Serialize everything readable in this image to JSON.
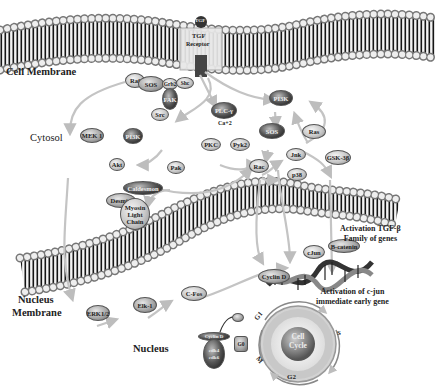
{
  "regions": {
    "cell_membrane": "Cell Membrane",
    "cytosol": "Cytosol",
    "nucleus_membrane_line1": "Nucleus",
    "nucleus_membrane_line2": "Membrane",
    "nucleus": "Nucleus"
  },
  "receptor": {
    "ligand": "TGF",
    "label_line1": "TGF",
    "label_line2": "Receptor"
  },
  "nodes": {
    "raf": "Raf",
    "sos_top": "SOS",
    "grb2": "Grb2",
    "shc": "Shc",
    "fak": "FAK",
    "src": "Src",
    "plc": "PLC-γ",
    "ca": "Ca+2",
    "pkc": "PKC",
    "pyk2": "Pyk2",
    "pi3k_top": "PI3K",
    "sos_mid": "SOS",
    "ras": "Ras",
    "mek1": "MEK 1",
    "pi3k_left": "PI3K",
    "akt": "Akt",
    "pak": "Pak",
    "rac": "Rac",
    "jnk": "Jnk",
    "p38": "p38",
    "gsk3b": "GSK-3β",
    "caldesmon": "Caldesmon",
    "desmin": "Desmin",
    "myosin_line1": "Myosin",
    "myosin_line2": "Light",
    "myosin_line3": "Chain",
    "erk12": "ERK1/2",
    "elk1": "Elk-1",
    "cfos": "C-Fos",
    "cjun": "cJun",
    "bcatenin": "B-catenin",
    "cyclin_d": "Cyclin D",
    "cyclin_complex_top": "Cyclin D",
    "cyclin_complex_line1": "cdk4",
    "cyclin_complex_line2": "cdk6",
    "g0": "G0"
  },
  "annotations": {
    "tgf_genes_line1": "Activation TGF-β",
    "tgf_genes_line2": "Family of genes",
    "cjun_gene_line1": "Activation of c-jun",
    "cjun_gene_line2": "immediate early gene"
  },
  "cell_cycle": {
    "center_line1": "Cell",
    "center_line2": "Cycle",
    "phases": [
      "G1",
      "S",
      "G2",
      "M"
    ]
  },
  "colors": {
    "arrow": "#c4c4c4",
    "membrane_head": "#e8e8e8",
    "membrane_tail": "#1a1a1a",
    "text": "#222222"
  }
}
